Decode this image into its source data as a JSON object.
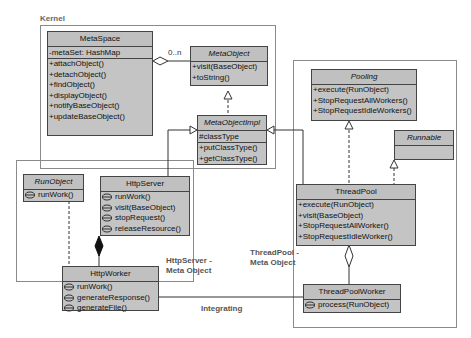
{
  "packages": {
    "kernel": {
      "label": "Kernel"
    },
    "http": {
      "label": "HttpServer - Meta Object",
      "line1": "HttpServer -",
      "line2": "Meta Object"
    },
    "pool": {
      "label": "ThreadPool - Meta Object",
      "line1": "ThreadPool -",
      "line2": "Meta Object"
    }
  },
  "classes": {
    "metaspace": {
      "name": "MetaSpace",
      "attrs": [
        "-metaSet: HashMap"
      ],
      "ops": [
        "+attachObject()",
        "+detachObject()",
        "+findObject()",
        "+displayObject()",
        "+notifyBaseObject()",
        "+updateBaseObject()"
      ]
    },
    "metaobject": {
      "name": "MetaObject",
      "abstract": true,
      "ops": [
        "+visit(BaseObject)",
        "+toString()"
      ]
    },
    "metaobjectimpl": {
      "name": "MetaObjectImpl",
      "abstract": true,
      "attrs": [
        "#classType"
      ],
      "ops": [
        "+putClassType()",
        "+getClassType()"
      ]
    },
    "pooling": {
      "name": "Pooling",
      "abstract": true,
      "ops": [
        "+execute(RunObject)",
        "+StopRequestAllWorkers()",
        "+StopRequestIdleWorkers()"
      ]
    },
    "runnable": {
      "name": "Runnable",
      "abstract": true
    },
    "runobject": {
      "name": "RunObject",
      "abstract": true,
      "ops": [
        "runWork()"
      ]
    },
    "httpserver": {
      "name": "HttpServer",
      "ops": [
        "runWork()",
        "visit(BaseObject)",
        "stopRequest()",
        "releaseResource()"
      ]
    },
    "httpworker": {
      "name": "HttpWorker",
      "ops": [
        "runWork()",
        "generateResponse()",
        "generateFile()"
      ]
    },
    "threadpool": {
      "name": "ThreadPool",
      "ops": [
        "+execute(RunObject)",
        "+visit(BaseObject)",
        "+StopRequestAllWorker()",
        "+StopRequestIdleWorker()"
      ]
    },
    "threadpoolworker": {
      "name": "ThreadPoolWorker",
      "ops": [
        "process(RunObject)"
      ]
    }
  },
  "relations": {
    "metaspace_metaobject_multiplicity": "0..n",
    "integrating_label": "Integrating"
  },
  "colors": {
    "class_fill": "#c4c4c4",
    "class_border": "#444444",
    "frame_border": "#8a8a8a"
  }
}
